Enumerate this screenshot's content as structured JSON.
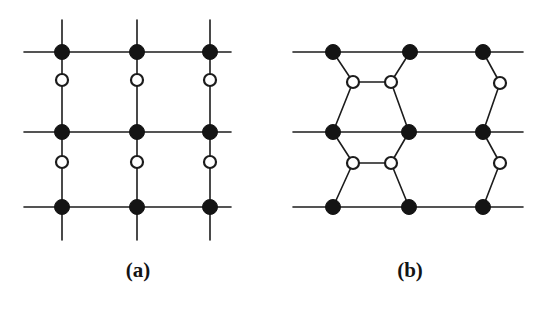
{
  "figure": {
    "width": 535,
    "height": 309,
    "background": "#ffffff",
    "ink_color": "#1a1a1a",
    "type": "two-panel-lattice-diagram"
  },
  "style": {
    "bond_color": "#1c1c1c",
    "bond_width": 1.6,
    "filled_node_fill": "#141414",
    "filled_node_stroke": "#141414",
    "open_node_fill": "#ffffff",
    "open_node_stroke": "#1c1c1c",
    "open_node_stroke_width": 2.2,
    "filled_node_radius": 7.5,
    "open_node_radius": 6.0
  },
  "panels": [
    {
      "id": "a",
      "label": "(a)",
      "label_x": 138,
      "label_y": 273,
      "lattice": "square",
      "bond_lines": [
        {
          "name": "horizontal-row-top",
          "x1": 24,
          "y1": 52,
          "x2": 231,
          "y2": 52
        },
        {
          "name": "horizontal-row-middle",
          "x1": 24,
          "y1": 132,
          "x2": 231,
          "y2": 132
        },
        {
          "name": "horizontal-row-bottom",
          "x1": 24,
          "y1": 207,
          "x2": 231,
          "y2": 207
        },
        {
          "name": "vertical-col-left",
          "x1": 62,
          "y1": 20,
          "x2": 62,
          "y2": 240
        },
        {
          "name": "vertical-col-center",
          "x1": 137,
          "y1": 20,
          "x2": 137,
          "y2": 240
        },
        {
          "name": "vertical-col-right",
          "x1": 210,
          "y1": 20,
          "x2": 210,
          "y2": 240
        }
      ],
      "filled_nodes": [
        {
          "name": "filled-node-r1c1",
          "x": 62,
          "y": 52
        },
        {
          "name": "filled-node-r1c2",
          "x": 137,
          "y": 52
        },
        {
          "name": "filled-node-r1c3",
          "x": 210,
          "y": 52
        },
        {
          "name": "filled-node-r2c1",
          "x": 62,
          "y": 132
        },
        {
          "name": "filled-node-r2c2",
          "x": 137,
          "y": 132
        },
        {
          "name": "filled-node-r2c3",
          "x": 210,
          "y": 132
        },
        {
          "name": "filled-node-r3c1",
          "x": 62,
          "y": 207
        },
        {
          "name": "filled-node-r3c2",
          "x": 137,
          "y": 207
        },
        {
          "name": "filled-node-r3c3",
          "x": 210,
          "y": 207
        }
      ],
      "open_nodes": [
        {
          "name": "open-node-u1c1",
          "x": 62,
          "y": 80
        },
        {
          "name": "open-node-u1c2",
          "x": 137,
          "y": 80
        },
        {
          "name": "open-node-u1c3",
          "x": 210,
          "y": 80
        },
        {
          "name": "open-node-u2c1",
          "x": 62,
          "y": 162
        },
        {
          "name": "open-node-u2c2",
          "x": 137,
          "y": 162
        },
        {
          "name": "open-node-u2c3",
          "x": 210,
          "y": 162
        }
      ]
    },
    {
      "id": "b",
      "label": "(b)",
      "label_x": 410,
      "label_y": 273,
      "lattice": "hexagonal-distorted",
      "bond_lines": [
        {
          "name": "horizontal-row-top",
          "x1": 293,
          "y1": 52,
          "x2": 523,
          "y2": 52
        },
        {
          "name": "horizontal-row-middle",
          "x1": 293,
          "y1": 132,
          "x2": 523,
          "y2": 132
        },
        {
          "name": "horizontal-row-bottom",
          "x1": 293,
          "y1": 207,
          "x2": 523,
          "y2": 207
        },
        {
          "name": "bond-a1",
          "x1": 333,
          "y1": 52,
          "x2": 353,
          "y2": 82
        },
        {
          "name": "bond-a2",
          "x1": 353,
          "y1": 82,
          "x2": 391,
          "y2": 82
        },
        {
          "name": "bond-a3",
          "x1": 391,
          "y1": 82,
          "x2": 410,
          "y2": 52
        },
        {
          "name": "bond-a4",
          "x1": 353,
          "y1": 82,
          "x2": 333,
          "y2": 132
        },
        {
          "name": "bond-a5",
          "x1": 391,
          "y1": 82,
          "x2": 409,
          "y2": 132
        },
        {
          "name": "bond-a6",
          "x1": 483,
          "y1": 52,
          "x2": 500,
          "y2": 83
        },
        {
          "name": "bond-a7",
          "x1": 500,
          "y1": 83,
          "x2": 483,
          "y2": 132
        },
        {
          "name": "bond-b1",
          "x1": 333,
          "y1": 132,
          "x2": 353,
          "y2": 163
        },
        {
          "name": "bond-b2",
          "x1": 353,
          "y1": 163,
          "x2": 391,
          "y2": 163
        },
        {
          "name": "bond-b3",
          "x1": 391,
          "y1": 163,
          "x2": 409,
          "y2": 132
        },
        {
          "name": "bond-b4",
          "x1": 353,
          "y1": 163,
          "x2": 333,
          "y2": 207
        },
        {
          "name": "bond-b5",
          "x1": 391,
          "y1": 163,
          "x2": 409,
          "y2": 207
        },
        {
          "name": "bond-b6",
          "x1": 483,
          "y1": 132,
          "x2": 500,
          "y2": 163
        },
        {
          "name": "bond-b7",
          "x1": 500,
          "y1": 163,
          "x2": 483,
          "y2": 207
        }
      ],
      "filled_nodes": [
        {
          "name": "filled-node-r1c1",
          "x": 333,
          "y": 52
        },
        {
          "name": "filled-node-r1c2",
          "x": 410,
          "y": 52
        },
        {
          "name": "filled-node-r1c3",
          "x": 483,
          "y": 52
        },
        {
          "name": "filled-node-r2c1",
          "x": 333,
          "y": 132
        },
        {
          "name": "filled-node-r2c2",
          "x": 409,
          "y": 132
        },
        {
          "name": "filled-node-r2c3",
          "x": 483,
          "y": 132
        },
        {
          "name": "filled-node-r3c1",
          "x": 333,
          "y": 207
        },
        {
          "name": "filled-node-r3c2",
          "x": 409,
          "y": 207
        },
        {
          "name": "filled-node-r3c3",
          "x": 483,
          "y": 207
        }
      ],
      "open_nodes": [
        {
          "name": "open-node-u1a",
          "x": 353,
          "y": 82
        },
        {
          "name": "open-node-u1b",
          "x": 391,
          "y": 82
        },
        {
          "name": "open-node-u1c",
          "x": 500,
          "y": 83
        },
        {
          "name": "open-node-u2a",
          "x": 353,
          "y": 163
        },
        {
          "name": "open-node-u2b",
          "x": 391,
          "y": 163
        },
        {
          "name": "open-node-u2c",
          "x": 500,
          "y": 163
        }
      ]
    }
  ]
}
